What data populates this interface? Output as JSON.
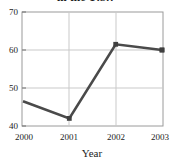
{
  "chart_data": {
    "type": "line",
    "title": "in the U.S.?",
    "title_clipped": true,
    "xlabel": "Year",
    "ylabel": "",
    "categories": [
      "2000",
      "2001",
      "2002",
      "2003"
    ],
    "x": [
      2000,
      2001,
      2002,
      2003
    ],
    "values": [
      46.5,
      42,
      61.5,
      60
    ],
    "series": [
      {
        "name": "",
        "values": [
          46.5,
          42,
          61.5,
          60
        ]
      }
    ],
    "xlim": [
      2000,
      2003
    ],
    "ylim": [
      40,
      70
    ],
    "ytick_labels": [
      "40",
      "50",
      "60",
      "70"
    ],
    "yticks": [
      40,
      50,
      60,
      70
    ],
    "xtick_labels": [
      "2000",
      "2001",
      "2002",
      "2003"
    ],
    "grid": true,
    "grid_horizontal": [
      50,
      60
    ],
    "grid_vertical": [
      2001,
      2002
    ],
    "legend": null,
    "legend_position": "none",
    "marker": "square",
    "line_color": "#4a4a4a",
    "grid_color": "#c9c9c9",
    "frame_color": "#9a9a9a",
    "background": "#ffffff"
  },
  "axes": {
    "y_ticks": [
      {
        "label": "70",
        "value": 70
      },
      {
        "label": "60",
        "value": 60
      },
      {
        "label": "50",
        "value": 50
      },
      {
        "label": "40",
        "value": 40
      }
    ],
    "x_ticks": [
      {
        "label": "2000",
        "value": 2000
      },
      {
        "label": "2001",
        "value": 2001
      },
      {
        "label": "2002",
        "value": 2002
      },
      {
        "label": "2003",
        "value": 2003
      }
    ],
    "x_axis_title": "Year"
  }
}
